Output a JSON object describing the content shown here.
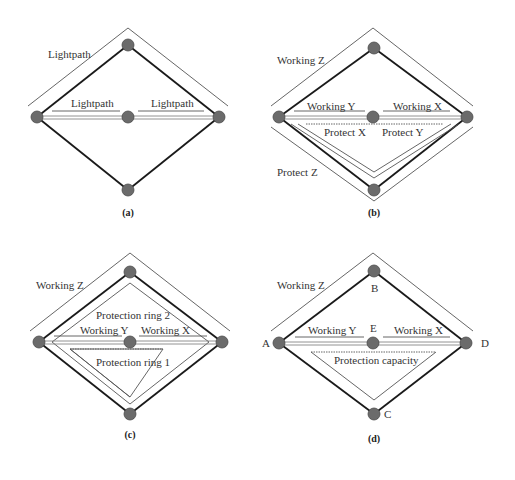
{
  "figure": {
    "panels": [
      {
        "id": "a",
        "caption": "(a)",
        "labels": {
          "outer": "Lightpath",
          "left_inner": "Lightpath",
          "right_inner": "Lightpath"
        }
      },
      {
        "id": "b",
        "caption": "(b)",
        "labels": {
          "working_z": "Working Z",
          "working_y": "Working Y",
          "working_x": "Working X",
          "protect_x": "Protect X",
          "protect_y": "Protect Y",
          "protect_z": "Protect Z"
        }
      },
      {
        "id": "c",
        "caption": "(c)",
        "labels": {
          "working_z": "Working Z",
          "ring2": "Protection ring 2",
          "working_y": "Working Y",
          "working_x": "Working X",
          "ring1": "Protection ring 1"
        }
      },
      {
        "id": "d",
        "caption": "(d)",
        "labels": {
          "working_z": "Working Z",
          "working_y": "Working Y",
          "working_x": "Working X",
          "protection": "Protection capacity"
        },
        "nodes": {
          "A": "A",
          "B": "B",
          "C": "C",
          "D": "D",
          "E": "E"
        }
      }
    ]
  }
}
